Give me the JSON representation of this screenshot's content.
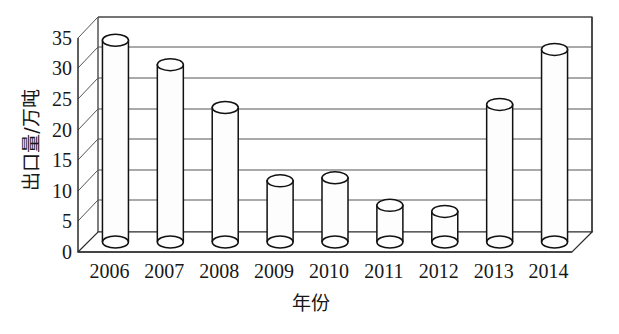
{
  "chart_data": {
    "type": "bar",
    "title": "",
    "subtitle": "",
    "xlabel": "年份",
    "ylabel": "出口量/万吨",
    "categories": [
      "2006",
      "2007",
      "2008",
      "2009",
      "2010",
      "2011",
      "2012",
      "2013",
      "2014"
    ],
    "values": [
      33,
      29,
      22,
      10,
      10.5,
      6,
      5,
      22.5,
      31.5
    ],
    "series": [
      {
        "name": "出口量",
        "values": [
          33,
          29,
          22,
          10,
          10.5,
          6,
          5,
          22.5,
          31.5
        ]
      }
    ],
    "ylim": [
      0,
      35
    ],
    "ytick_labels": [
      "0",
      "5",
      "10",
      "15",
      "20",
      "25",
      "30",
      "35"
    ],
    "ytick_values": [
      0,
      5,
      10,
      15,
      20,
      25,
      30,
      35
    ],
    "grid": true,
    "legend": false,
    "legend_position": "none",
    "style": "3d-cylinder",
    "bar_fill_color": "#fdfdfd",
    "bar_line_color": "#111111",
    "grid_color": "#555555",
    "background_color": "#ffffff"
  },
  "axes": {
    "y_title": "出口量/万吨",
    "x_title": "年份"
  },
  "ticks": {
    "y": [
      "35",
      "30",
      "25",
      "20",
      "15",
      "10",
      "5",
      "0"
    ],
    "x": [
      "2006",
      "2007",
      "2008",
      "2009",
      "2010",
      "2011",
      "2012",
      "2013",
      "2014"
    ]
  }
}
